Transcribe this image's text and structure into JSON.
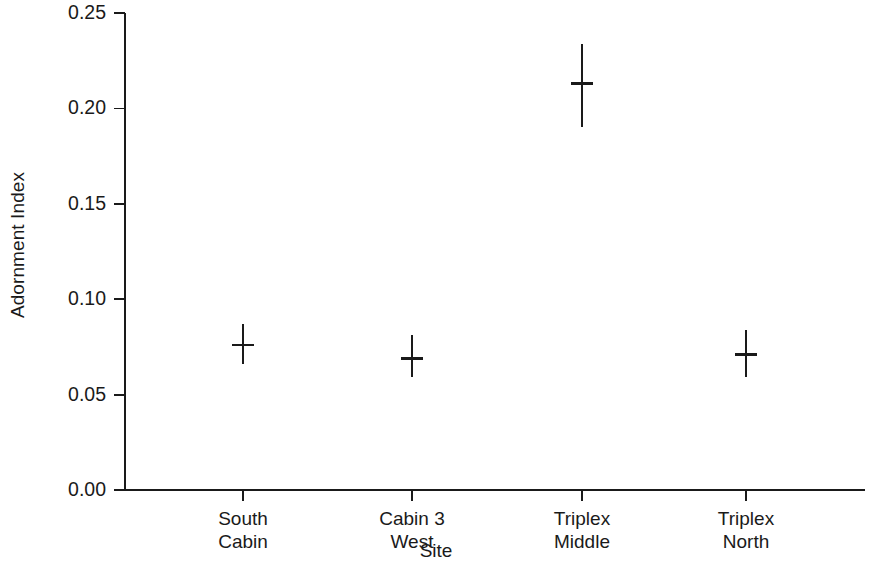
{
  "chart_data": {
    "type": "scatter",
    "title": "",
    "xlabel": "Site",
    "ylabel": "Adornment Index",
    "categories": [
      "South Cabin",
      "Cabin 3 West",
      "Triplex Middle",
      "Triplex North"
    ],
    "category_lines": [
      [
        "South",
        "Cabin"
      ],
      [
        "Cabin 3",
        "West"
      ],
      [
        "Triplex",
        "Middle"
      ],
      [
        "Triplex",
        "North"
      ]
    ],
    "values": [
      0.076,
      0.069,
      0.213,
      0.071
    ],
    "error_low": [
      0.066,
      0.059,
      0.19,
      0.059
    ],
    "error_high": [
      0.087,
      0.081,
      0.234,
      0.084
    ],
    "series": [
      {
        "name": "Adornment Index",
        "marker": "horizontal-tick-with-vertical-errorbar",
        "values": [
          0.076,
          0.069,
          0.213,
          0.071
        ],
        "error_low": [
          0.066,
          0.059,
          0.19,
          0.059
        ],
        "error_high": [
          0.087,
          0.081,
          0.234,
          0.084
        ]
      }
    ],
    "ylim": [
      0.0,
      0.25
    ],
    "yticks": [
      0.0,
      0.05,
      0.1,
      0.15,
      0.2,
      0.25
    ],
    "ytick_labels": [
      "0.00",
      "0.05",
      "0.10",
      "0.15",
      "0.20",
      "0.25"
    ],
    "grid": false,
    "legend": "none",
    "line_color": "#1a1a1a",
    "background_color": "#ffffff"
  }
}
